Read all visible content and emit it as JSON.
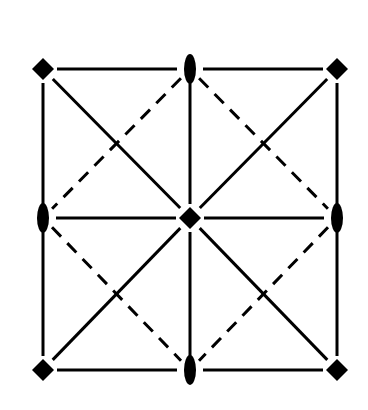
{
  "diagram": {
    "type": "symmetry-element-diagram",
    "colors": {
      "stroke": "#000000",
      "background": "#ffffff"
    },
    "nodes": [
      {
        "id": "tl",
        "shape": "diamond",
        "x": 43,
        "y": 69
      },
      {
        "id": "tc",
        "shape": "ellipse",
        "x": 190,
        "y": 69
      },
      {
        "id": "tr",
        "shape": "diamond",
        "x": 337,
        "y": 69
      },
      {
        "id": "ml",
        "shape": "ellipse",
        "x": 43,
        "y": 218
      },
      {
        "id": "c",
        "shape": "diamond",
        "x": 190,
        "y": 218
      },
      {
        "id": "mr",
        "shape": "ellipse",
        "x": 337,
        "y": 218
      },
      {
        "id": "bl",
        "shape": "diamond",
        "x": 43,
        "y": 370
      },
      {
        "id": "bc",
        "shape": "ellipse",
        "x": 190,
        "y": 370
      },
      {
        "id": "br",
        "shape": "diamond",
        "x": 337,
        "y": 370
      }
    ],
    "edges": [
      {
        "from": "tl",
        "to": "tc",
        "style": "solid"
      },
      {
        "from": "tc",
        "to": "tr",
        "style": "solid"
      },
      {
        "from": "bl",
        "to": "bc",
        "style": "solid"
      },
      {
        "from": "bc",
        "to": "br",
        "style": "solid"
      },
      {
        "from": "tl",
        "to": "ml",
        "style": "solid"
      },
      {
        "from": "ml",
        "to": "bl",
        "style": "solid"
      },
      {
        "from": "tr",
        "to": "mr",
        "style": "solid"
      },
      {
        "from": "mr",
        "to": "br",
        "style": "solid"
      },
      {
        "from": "tc",
        "to": "c",
        "style": "solid"
      },
      {
        "from": "c",
        "to": "bc",
        "style": "solid"
      },
      {
        "from": "ml",
        "to": "c",
        "style": "solid"
      },
      {
        "from": "c",
        "to": "mr",
        "style": "solid"
      },
      {
        "from": "tl",
        "to": "c",
        "style": "solid"
      },
      {
        "from": "c",
        "to": "br",
        "style": "solid"
      },
      {
        "from": "tr",
        "to": "c",
        "style": "solid"
      },
      {
        "from": "c",
        "to": "bl",
        "style": "solid"
      },
      {
        "from": "tc",
        "to": "ml",
        "style": "dashed"
      },
      {
        "from": "tc",
        "to": "mr",
        "style": "dashed"
      },
      {
        "from": "ml",
        "to": "bc",
        "style": "dashed"
      },
      {
        "from": "mr",
        "to": "bc",
        "style": "dashed"
      }
    ]
  }
}
